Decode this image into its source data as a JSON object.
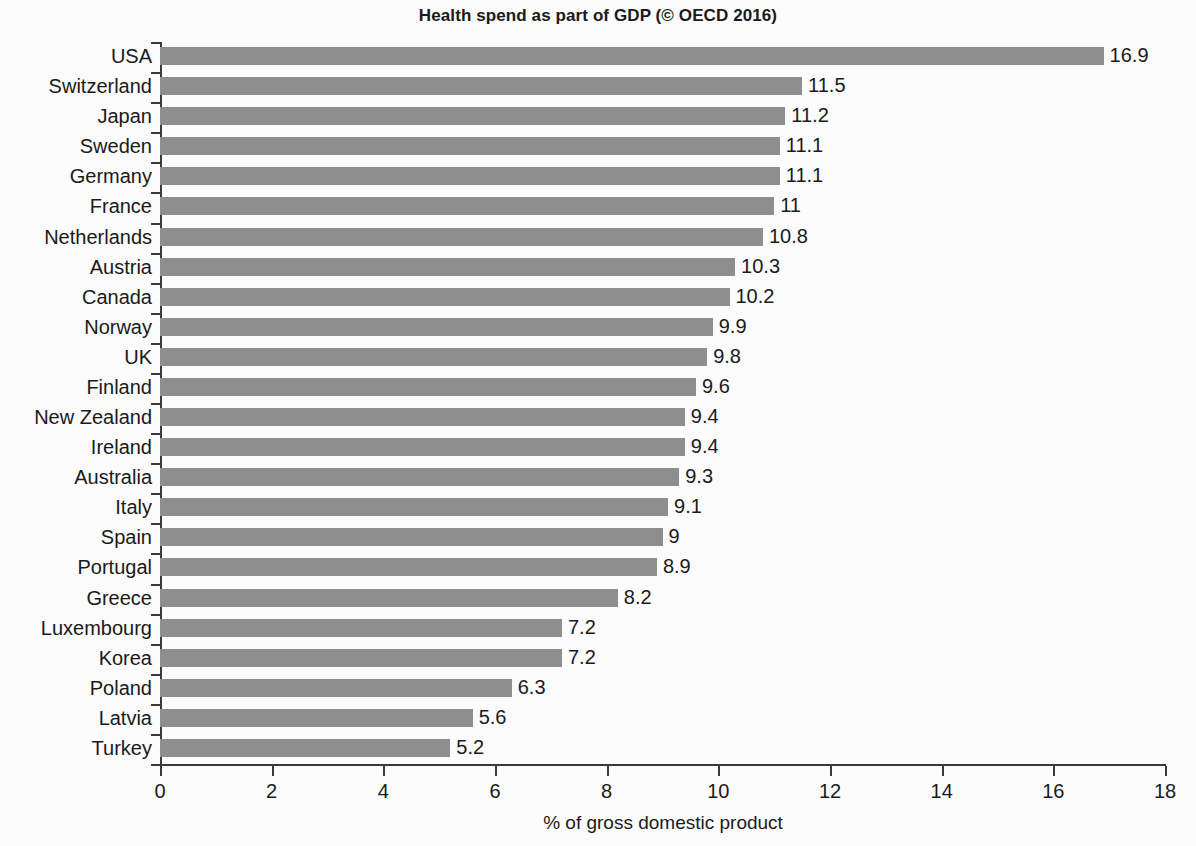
{
  "chart_data": {
    "type": "bar",
    "orientation": "horizontal",
    "title": "Health spend as part of GDP (© OECD 2016)",
    "xlabel": "% of gross domestic product",
    "ylabel": "",
    "xlim": [
      0,
      18
    ],
    "xticks": [
      0,
      2,
      4,
      6,
      8,
      10,
      12,
      14,
      16,
      18
    ],
    "xtick_labels": [
      "0",
      "2",
      "4",
      "6",
      "8",
      "10",
      "12",
      "14",
      "16",
      "18"
    ],
    "grid": false,
    "legend": null,
    "bar_color": "#8e8e8e",
    "background_color": "#fbfbfb",
    "text_color": "#1a1a1a",
    "categories": [
      "USA",
      "Switzerland",
      "Japan",
      "Sweden",
      "Germany",
      "France",
      "Netherlands",
      "Austria",
      "Canada",
      "Norway",
      "UK",
      "Finland",
      "New Zealand",
      "Ireland",
      "Australia",
      "Italy",
      "Spain",
      "Portugal",
      "Greece",
      "Luxembourg",
      "Korea",
      "Poland",
      "Latvia",
      "Turkey"
    ],
    "values": [
      16.9,
      11.5,
      11.2,
      11.1,
      11.1,
      11,
      10.8,
      10.3,
      10.2,
      9.9,
      9.8,
      9.6,
      9.4,
      9.4,
      9.3,
      9.1,
      9,
      8.9,
      8.2,
      7.2,
      7.2,
      6.3,
      5.6,
      5.2
    ],
    "value_labels": [
      "16.9",
      "11.5",
      "11.2",
      "11.1",
      "11.1",
      "11",
      "10.8",
      "10.3",
      "10.2",
      "9.9",
      "9.8",
      "9.6",
      "9.4",
      "9.4",
      "9.3",
      "9.1",
      "9",
      "8.9",
      "8.2",
      "7.2",
      "7.2",
      "6.3",
      "5.6",
      "5.2"
    ]
  }
}
